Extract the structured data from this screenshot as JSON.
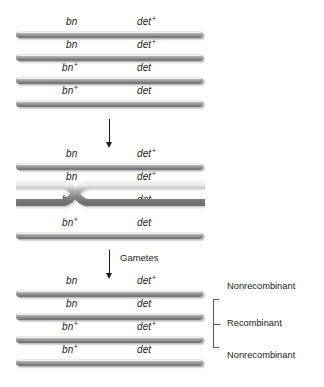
{
  "groups": [
    {
      "id": "homologous-pair",
      "chromatids": [
        {
          "left_gene": "bn",
          "left_sup": "",
          "right_gene": "det",
          "right_sup": "+"
        },
        {
          "left_gene": "bn",
          "left_sup": "",
          "right_gene": "det",
          "right_sup": "+"
        },
        {
          "left_gene": "bn",
          "left_sup": "+",
          "right_gene": "det",
          "right_sup": ""
        },
        {
          "left_gene": "bn",
          "left_sup": "+",
          "right_gene": "det",
          "right_sup": ""
        }
      ]
    },
    {
      "id": "crossing-over",
      "chromatids": [
        {
          "left_gene": "bn",
          "left_sup": "",
          "right_gene": "det",
          "right_sup": "+"
        },
        {
          "left_gene": "bn",
          "left_sup": "",
          "right_gene": "det",
          "right_sup": "+"
        },
        {
          "left_gene": "bn",
          "left_sup": "+",
          "right_gene": "det",
          "right_sup": ""
        },
        {
          "left_gene": "bn",
          "left_sup": "+",
          "right_gene": "det",
          "right_sup": ""
        }
      ]
    },
    {
      "id": "gametes",
      "chromatids": [
        {
          "left_gene": "bn",
          "left_sup": "",
          "right_gene": "det",
          "right_sup": "+",
          "outcome": "Nonrecombinant"
        },
        {
          "left_gene": "bn",
          "left_sup": "",
          "right_gene": "det",
          "right_sup": "",
          "outcome": "Recombinant"
        },
        {
          "left_gene": "bn",
          "left_sup": "+",
          "right_gene": "det",
          "right_sup": "+",
          "outcome": "Recombinant"
        },
        {
          "left_gene": "bn",
          "left_sup": "+",
          "right_gene": "det",
          "right_sup": "",
          "outcome": "Nonrecombinant"
        }
      ]
    }
  ],
  "arrows": [
    {
      "id": "meiosis-arrow",
      "label": ""
    },
    {
      "id": "gametes-arrow",
      "label": "Gametes"
    }
  ],
  "outcome_labels": {
    "nonrecombinant_top": "Nonrecombinant",
    "recombinant": "Recombinant",
    "nonrecombinant_bottom": "Nonrecombinant"
  },
  "colors": {
    "bar_light": "#f4f4f4",
    "bar_mid": "#9a9a9a",
    "bar_dark": "#6e6e6e",
    "text": "#1b1b1b",
    "bracket": "#595959",
    "background": "#ffffff"
  }
}
